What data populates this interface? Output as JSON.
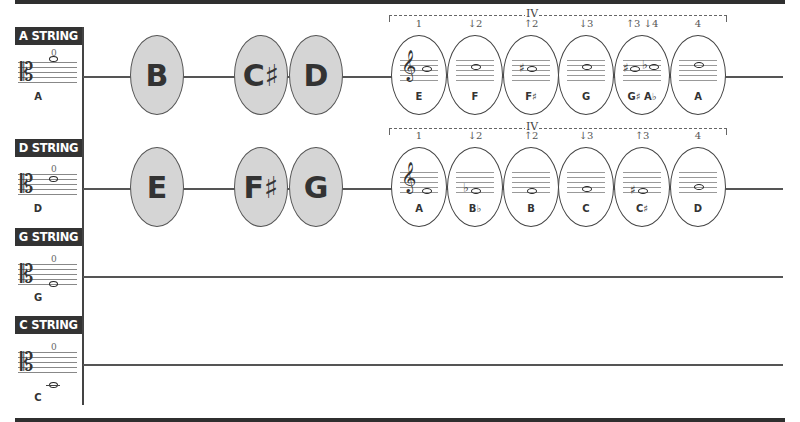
{
  "strings": [
    {
      "label": "A STRING",
      "open_finger": "0",
      "open_note": "A"
    },
    {
      "label": "D STRING",
      "open_finger": "0",
      "open_note": "D"
    },
    {
      "label": "G STRING",
      "open_finger": "0",
      "open_note": "G"
    },
    {
      "label": "C STRING",
      "open_finger": "0",
      "open_note": "C"
    }
  ],
  "a_string": {
    "gray_notes": [
      "B",
      "C♯",
      "D"
    ],
    "position_label": "IV",
    "white_notes": [
      {
        "finger": "1",
        "note": "E",
        "marks": ""
      },
      {
        "finger": "↓2",
        "note": "F",
        "marks": ""
      },
      {
        "finger": "↑2",
        "note": "F♯",
        "marks": "♯"
      },
      {
        "finger": "↓3",
        "note": "G",
        "marks": ""
      },
      {
        "finger": "↑3 ↓4",
        "note": "G♯ A♭",
        "marks": "♯ ♭"
      },
      {
        "finger": "4",
        "note": "A",
        "marks": ""
      }
    ]
  },
  "d_string": {
    "gray_notes": [
      "E",
      "F♯",
      "G"
    ],
    "position_label": "IV",
    "white_notes": [
      {
        "finger": "1",
        "note": "A",
        "marks": ""
      },
      {
        "finger": "↓2",
        "note": "B♭",
        "marks": "♭"
      },
      {
        "finger": "↑2",
        "note": "B",
        "marks": ""
      },
      {
        "finger": "↓3",
        "note": "C",
        "marks": ""
      },
      {
        "finger": "↑3",
        "note": "C♯",
        "marks": "♯"
      },
      {
        "finger": "4",
        "note": "D",
        "marks": ""
      }
    ]
  },
  "icons": {
    "clef": "𝄡",
    "treble": "𝄞",
    "sharp": "♯",
    "flat": "♭"
  }
}
